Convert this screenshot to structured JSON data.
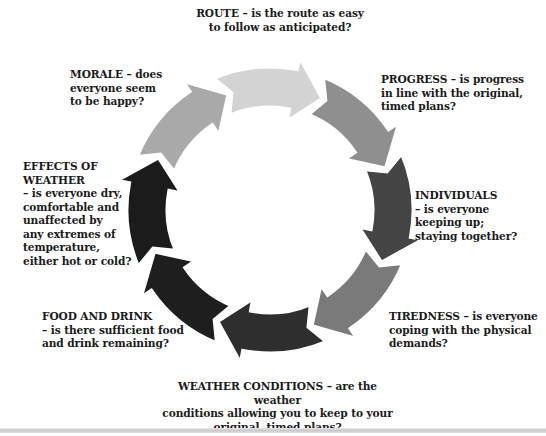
{
  "diagram": {
    "type": "cycle",
    "center": [
      270,
      210
    ],
    "outer_radius": 143,
    "inner_radius": 103,
    "segments": [
      {
        "id": "route",
        "color": "#d3d3d3"
      },
      {
        "id": "progress",
        "color": "#8f8f8f"
      },
      {
        "id": "individuals",
        "color": "#444444"
      },
      {
        "id": "tiredness",
        "color": "#7a7a7a"
      },
      {
        "id": "weather-conditions",
        "color": "#2e2e2e"
      },
      {
        "id": "food-and-drink",
        "color": "#1e1e1e"
      },
      {
        "id": "effects-of-weather",
        "color": "#1b1b1b"
      },
      {
        "id": "morale",
        "color": "#a9a9a9"
      }
    ]
  },
  "labels": {
    "route": {
      "head": "ROUTE",
      "lines": [
        "ROUTE – is the route as easy",
        "to follow as anticipated?"
      ]
    },
    "progress": {
      "head": "PROGRESS",
      "lines": [
        "PROGRESS – is progress",
        "in line with the original,",
        "timed plans?"
      ]
    },
    "individuals": {
      "head": "INDIVIDUALS",
      "lines": [
        "INDIVIDUALS",
        "– is everyone",
        "keeping up;",
        "staying together?"
      ]
    },
    "tiredness": {
      "head": "TIREDNESS",
      "lines": [
        "TIREDNESS – is everyone",
        "coping with the physical",
        "demands?"
      ]
    },
    "weather_conditions": {
      "head": "WEATHER CONDITIONS",
      "lines": [
        "WEATHER CONDITIONS – are the weather",
        "conditions allowing you to keep to your",
        "original, timed plans?"
      ]
    },
    "food_and_drink": {
      "head": "FOOD AND DRINK",
      "lines": [
        "FOOD AND DRINK",
        "– is there sufficient food",
        "and drink remaining?"
      ]
    },
    "effects_of_weather": {
      "head": "EFFECTS OF WEATHER",
      "lines": [
        "EFFECTS OF",
        "WEATHER",
        "– is everyone dry,",
        "comfortable and",
        "unaffected by",
        "any extremes of",
        "temperature,",
        "either hot or cold?"
      ]
    },
    "morale": {
      "head": "MORALE",
      "lines": [
        "MORALE – does",
        "everyone seem",
        "to be happy?"
      ]
    }
  }
}
